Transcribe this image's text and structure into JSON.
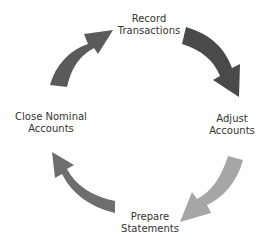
{
  "diagram": {
    "type": "cycle",
    "steps": [
      {
        "id": "record",
        "line1": "Record",
        "line2": "Transactions"
      },
      {
        "id": "adjust",
        "line1": "Adjust",
        "line2": "Accounts"
      },
      {
        "id": "prepare",
        "line1": "Prepare",
        "line2": "Statements"
      },
      {
        "id": "close",
        "line1": "Close Nominal",
        "line2": "Accounts"
      }
    ],
    "arrows": [
      {
        "from": "close",
        "to": "record",
        "color": "#5a5a5a"
      },
      {
        "from": "record",
        "to": "adjust",
        "color": "#4a4a4a"
      },
      {
        "from": "adjust",
        "to": "prepare",
        "color": "#a6a6a6"
      },
      {
        "from": "prepare",
        "to": "close",
        "color": "#6e6e6e"
      }
    ]
  }
}
